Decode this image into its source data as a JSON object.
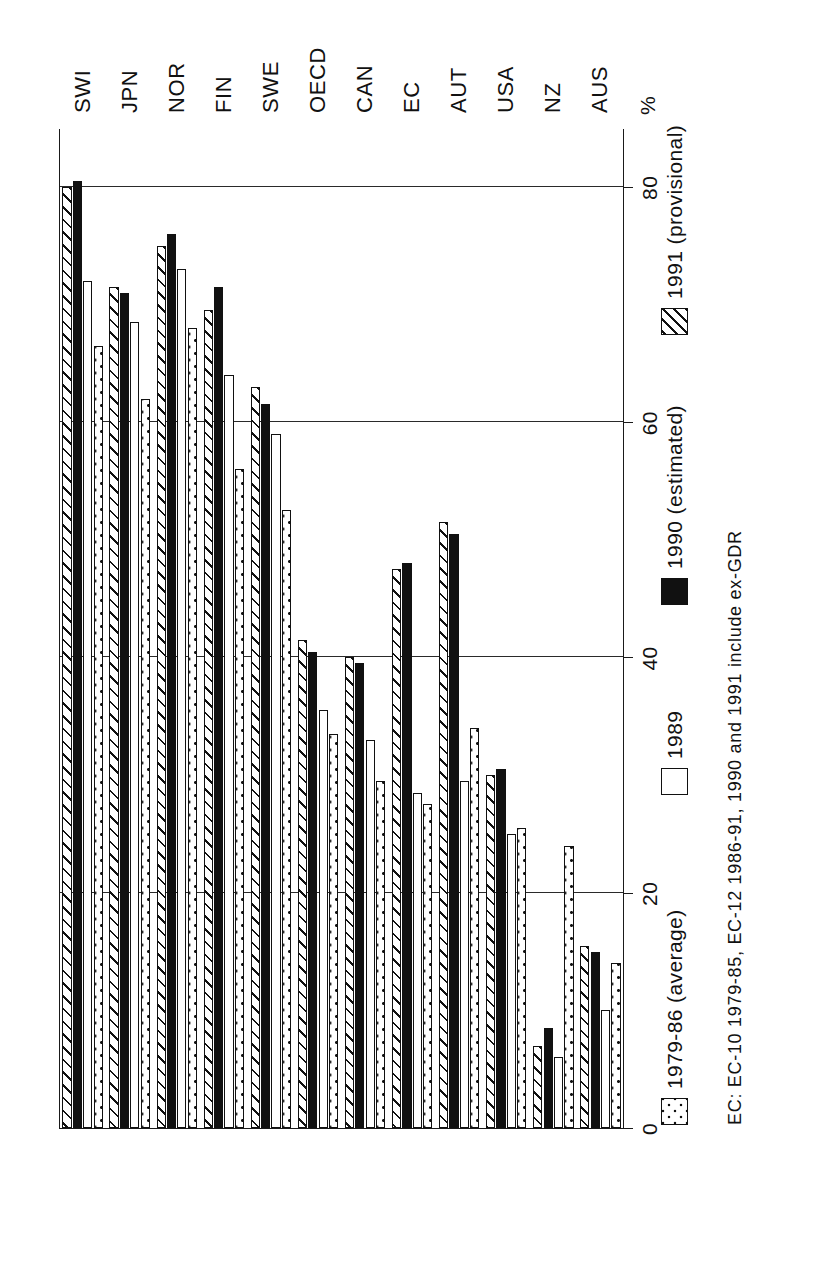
{
  "chart_data": {
    "type": "bar",
    "orientation": "horizontal-rotated",
    "title": "",
    "xlabel": "",
    "ylabel": "%",
    "unit_label": "%",
    "ylim": [
      0,
      85
    ],
    "axis_ticks": [
      0,
      20,
      40,
      60,
      80
    ],
    "grid": true,
    "legend_position": "below",
    "categories": [
      "SWI",
      "JPN",
      "NOR",
      "FIN",
      "SWE",
      "OECD",
      "CAN",
      "EC",
      "AUT",
      "USA",
      "NZ",
      "AUS"
    ],
    "series": [
      {
        "name": "1979-86 (average)",
        "key": "avg",
        "pattern": "dotted",
        "values": [
          66.5,
          62.0,
          68.0,
          56.0,
          52.5,
          33.5,
          29.5,
          27.5,
          34.0,
          25.5,
          24.0,
          14.0
        ]
      },
      {
        "name": "1989",
        "key": "y1989",
        "pattern": "white",
        "values": [
          72.0,
          68.5,
          73.0,
          64.0,
          59.0,
          35.5,
          33.0,
          28.5,
          29.5,
          25.0,
          6.0,
          10.0
        ]
      },
      {
        "name": "1990 (estimated)",
        "key": "y1990",
        "pattern": "solid-black",
        "values": [
          80.5,
          71.0,
          76.0,
          71.5,
          61.5,
          40.5,
          39.5,
          48.0,
          50.5,
          30.5,
          8.5,
          15.0
        ]
      },
      {
        "name": "1991 (provisional)",
        "key": "y1991",
        "pattern": "hatched",
        "values": [
          80.0,
          71.5,
          75.0,
          69.5,
          63.0,
          41.5,
          40.0,
          47.5,
          51.5,
          30.0,
          7.0,
          15.5
        ]
      }
    ],
    "footnote": "EC: EC-10  1979-85, EC-12  1986-91, 1990 and 1991 include ex-GDR"
  },
  "axis": {
    "unit": "%",
    "tick_labels": [
      "0",
      "20",
      "40",
      "60",
      "80"
    ]
  },
  "legend": {
    "items": [
      {
        "label": "1979-86 (average)",
        "key": "avg"
      },
      {
        "label": "1989",
        "key": "y1989"
      },
      {
        "label": "1990 (estimated)",
        "key": "y1990"
      },
      {
        "label": "1991 (provisional)",
        "key": "y1991"
      }
    ]
  },
  "footnote": {
    "text": "EC: EC-10  1979-85, EC-12  1986-91, 1990 and 1991 include ex-GDR"
  }
}
